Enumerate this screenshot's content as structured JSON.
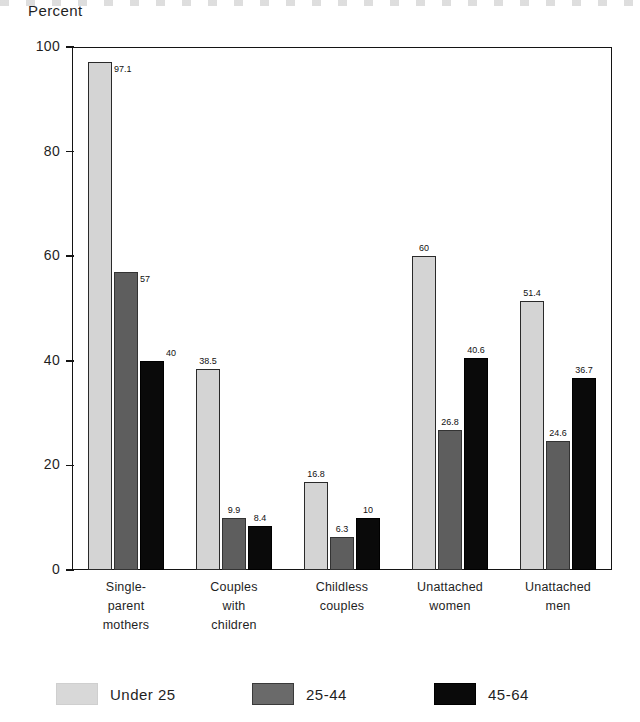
{
  "chart_data": {
    "type": "bar",
    "title": "",
    "ylabel": "Percent",
    "xlabel": "",
    "ylim": [
      0,
      100
    ],
    "yticks": [
      0,
      20,
      40,
      60,
      80,
      100
    ],
    "grid": false,
    "legend_position": "bottom",
    "categories": [
      "Single-\nparent\nmothers",
      "Couples\nwith\nchildren",
      "Childless\ncouples",
      "Unattached\nwomen",
      "Unattached\nmen"
    ],
    "category_lines": [
      [
        "Single-",
        "parent",
        "mothers"
      ],
      [
        "Couples",
        "with",
        "children"
      ],
      [
        "Childless",
        "couples"
      ],
      [
        "Unattached",
        "women"
      ],
      [
        "Unattached",
        "men"
      ]
    ],
    "series": [
      {
        "name": "Under 25",
        "color": "#d4d4d4",
        "values": [
          97.1,
          38.5,
          16.8,
          60,
          51.4
        ],
        "labels": [
          "97.1",
          "38.5",
          "16.8",
          "60",
          "51.4"
        ]
      },
      {
        "name": "25-44",
        "color": "#5e5e5e",
        "values": [
          57,
          9.9,
          6.3,
          26.8,
          24.6
        ],
        "labels": [
          "57",
          "9.9",
          "6.3",
          "26.8",
          "24.6"
        ]
      },
      {
        "name": "45-64",
        "color": "#0a0a0a",
        "values": [
          40,
          8.4,
          10,
          40.6,
          36.7
        ],
        "labels": [
          "40",
          "8.4",
          "10",
          "40.6",
          "36.7"
        ]
      }
    ]
  },
  "legend": {
    "items": [
      {
        "label": "Under 25",
        "swatch": "light"
      },
      {
        "label": "25-44",
        "swatch": "mid"
      },
      {
        "label": "45-64",
        "swatch": "dark"
      }
    ]
  },
  "axis": {
    "y_title": "Percent",
    "y_tick_labels": [
      "100",
      "80",
      "60",
      "40",
      "20",
      "0"
    ]
  }
}
